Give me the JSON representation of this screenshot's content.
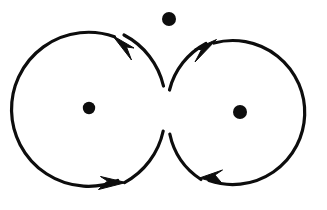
{
  "canvas": {
    "width": 327,
    "height": 210,
    "background_color": "#ffffff",
    "stroke_color": "#0d0d0d",
    "title": "Two circular field loops with opposite circulation and three marked points"
  },
  "chart_data": {
    "type": "diagram",
    "title": "",
    "elements": [
      {
        "name": "left-loop",
        "shape": "circle",
        "cx": 89,
        "cy": 108,
        "r": 77,
        "stroke_width": 3.2,
        "fill": "none",
        "direction": "counterclockwise",
        "arrow_positions_deg": [
          70,
          250
        ]
      },
      {
        "name": "right-loop",
        "shape": "circle",
        "cx": 240,
        "cy": 112,
        "r": 72,
        "stroke_width": 3.2,
        "fill": "none",
        "direction": "clockwise",
        "arrow_positions_deg": [
          115,
          290
        ]
      },
      {
        "name": "left-center-dot",
        "shape": "dot",
        "cx": 89,
        "cy": 108,
        "r": 6.2
      },
      {
        "name": "right-center-dot",
        "shape": "dot",
        "cx": 240,
        "cy": 112,
        "r": 7.0
      },
      {
        "name": "top-free-dot",
        "shape": "dot",
        "cx": 169,
        "cy": 19,
        "r": 7.0
      }
    ],
    "arrows": [
      {
        "name": "left-loop-top-arrow",
        "tip_x": 118,
        "tip_y": 38,
        "points_toward": "up-left",
        "angle_deg": 205
      },
      {
        "name": "left-loop-bottom-arrow",
        "tip_x": 118,
        "tip_y": 182,
        "points_toward": "right",
        "angle_deg": 22
      },
      {
        "name": "right-loop-top-arrow",
        "tip_x": 214,
        "tip_y": 41,
        "points_toward": "up-right",
        "angle_deg": -30
      },
      {
        "name": "right-loop-bottom-arrow",
        "tip_x": 207,
        "tip_y": 179,
        "points_toward": "left",
        "angle_deg": 200
      }
    ],
    "labels": [],
    "legend": [],
    "grid": false
  }
}
